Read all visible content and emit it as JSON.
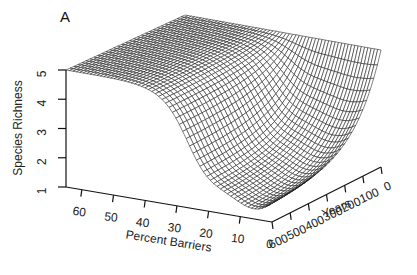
{
  "panel_label": "A",
  "chart_data": {
    "type": "surface3d",
    "title": "",
    "panel": "A",
    "zlabel": "Species Richness",
    "xlabel": "Percent Barriers",
    "ylabel": "Years",
    "z_ticks": [
      "1",
      "2",
      "3",
      "4",
      "5"
    ],
    "x_ticks": [
      "60",
      "50",
      "40",
      "30",
      "20",
      "10",
      "0"
    ],
    "y_ticks": [
      "600",
      "500",
      "400",
      "300",
      "200",
      "100",
      "0"
    ],
    "zlim": [
      1,
      5
    ],
    "xlim": [
      0,
      65
    ],
    "ylim": [
      0,
      600
    ],
    "surface_samples": [
      {
        "percent_barriers": 65,
        "years": 0,
        "richness": 5
      },
      {
        "percent_barriers": 65,
        "years": 600,
        "richness": 5
      },
      {
        "percent_barriers": 40,
        "years": 600,
        "richness": 4.9
      },
      {
        "percent_barriers": 30,
        "years": 600,
        "richness": 3.5
      },
      {
        "percent_barriers": 20,
        "years": 600,
        "richness": 2.0
      },
      {
        "percent_barriers": 10,
        "years": 600,
        "richness": 1.4
      },
      {
        "percent_barriers": 0,
        "years": 600,
        "richness": 1.6
      },
      {
        "percent_barriers": 0,
        "years": 300,
        "richness": 1.8
      },
      {
        "percent_barriers": 0,
        "years": 100,
        "richness": 3.0
      },
      {
        "percent_barriers": 0,
        "years": 0,
        "richness": 5
      }
    ]
  }
}
